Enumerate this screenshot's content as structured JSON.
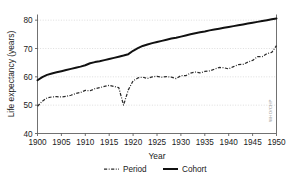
{
  "chart_data": {
    "type": "line",
    "title": "",
    "xlabel": "Year",
    "ylabel": "Life expectancy (years)",
    "xlim": [
      1900,
      1950
    ],
    "ylim": [
      40,
      82
    ],
    "xticks": [
      1900,
      1905,
      1910,
      1915,
      1920,
      1925,
      1930,
      1935,
      1940,
      1945,
      1950
    ],
    "yticks": [
      40,
      50,
      60,
      70,
      80
    ],
    "grid": true,
    "legend_position": "bottom",
    "watermark": "WHO/CHP",
    "series": [
      {
        "name": "Period",
        "style": "dash-dot",
        "x": [
          1900,
          1901,
          1902,
          1903,
          1904,
          1905,
          1906,
          1907,
          1908,
          1909,
          1910,
          1911,
          1912,
          1913,
          1914,
          1915,
          1916,
          1917,
          1918,
          1919,
          1920,
          1921,
          1922,
          1923,
          1924,
          1925,
          1926,
          1927,
          1928,
          1929,
          1930,
          1931,
          1932,
          1933,
          1934,
          1935,
          1936,
          1937,
          1938,
          1939,
          1940,
          1941,
          1942,
          1943,
          1944,
          1945,
          1946,
          1947,
          1948,
          1949,
          1950
        ],
        "values": [
          49.6,
          51.4,
          52.6,
          52.9,
          53.0,
          52.9,
          53.1,
          53.5,
          54.1,
          54.5,
          55.2,
          55.1,
          55.8,
          56.2,
          56.6,
          57.0,
          56.6,
          56.2,
          50.0,
          55.4,
          58.6,
          59.6,
          59.9,
          59.4,
          60.0,
          60.2,
          59.9,
          60.1,
          59.9,
          59.4,
          60.4,
          60.4,
          61.3,
          61.7,
          61.4,
          61.9,
          62.1,
          62.7,
          63.3,
          63.2,
          62.8,
          63.6,
          64.3,
          64.4,
          65.2,
          65.8,
          67.1,
          67.1,
          68.2,
          68.6,
          71.0
        ]
      },
      {
        "name": "Cohort",
        "style": "solid",
        "x": [
          1900,
          1901,
          1902,
          1903,
          1904,
          1905,
          1906,
          1907,
          1908,
          1909,
          1910,
          1911,
          1912,
          1913,
          1914,
          1915,
          1916,
          1917,
          1918,
          1919,
          1920,
          1921,
          1922,
          1923,
          1924,
          1925,
          1926,
          1927,
          1928,
          1929,
          1930,
          1931,
          1932,
          1933,
          1934,
          1935,
          1936,
          1937,
          1938,
          1939,
          1940,
          1941,
          1942,
          1943,
          1944,
          1945,
          1946,
          1947,
          1948,
          1949,
          1950
        ],
        "values": [
          58.8,
          59.9,
          60.7,
          61.2,
          61.6,
          62.0,
          62.4,
          62.8,
          63.2,
          63.6,
          64.1,
          64.8,
          65.2,
          65.5,
          65.9,
          66.3,
          66.7,
          67.1,
          67.5,
          68.0,
          69.2,
          70.1,
          70.9,
          71.4,
          71.9,
          72.3,
          72.7,
          73.1,
          73.5,
          73.8,
          74.2,
          74.6,
          75.0,
          75.4,
          75.7,
          76.0,
          76.4,
          76.7,
          77.0,
          77.3,
          77.6,
          77.9,
          78.2,
          78.5,
          78.8,
          79.1,
          79.4,
          79.7,
          80.0,
          80.3,
          80.6
        ]
      }
    ]
  },
  "legend": {
    "items": [
      {
        "label": "Period"
      },
      {
        "label": "Cohort"
      }
    ]
  }
}
